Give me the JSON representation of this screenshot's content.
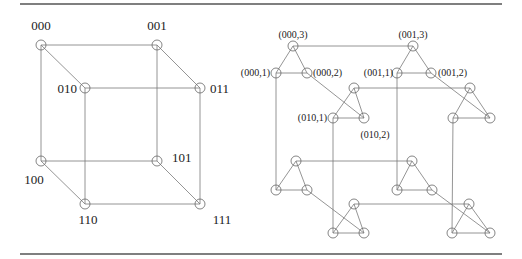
{
  "figure": {
    "left": {
      "title": "3-cube",
      "nodes": [
        {
          "id": "000",
          "label": "000",
          "x": 41,
          "y": 45,
          "lx": 41,
          "ly": 30,
          "anchor": "middle"
        },
        {
          "id": "001",
          "label": "001",
          "x": 157,
          "y": 45,
          "lx": 157,
          "ly": 30,
          "anchor": "middle"
        },
        {
          "id": "010",
          "label": "010",
          "x": 85,
          "y": 88,
          "lx": 77,
          "ly": 93,
          "anchor": "end"
        },
        {
          "id": "011",
          "label": "011",
          "x": 200,
          "y": 88,
          "lx": 210,
          "ly": 93,
          "anchor": "start"
        },
        {
          "id": "100",
          "label": "100",
          "x": 41,
          "y": 161,
          "lx": 34,
          "ly": 184,
          "anchor": "middle"
        },
        {
          "id": "101",
          "label": "101",
          "x": 157,
          "y": 161,
          "lx": 172,
          "ly": 162,
          "anchor": "start"
        },
        {
          "id": "110",
          "label": "110",
          "x": 85,
          "y": 204,
          "lx": 88,
          "ly": 224,
          "anchor": "middle"
        },
        {
          "id": "111",
          "label": "111",
          "x": 200,
          "y": 204,
          "lx": 222,
          "ly": 224,
          "anchor": "middle"
        }
      ],
      "edges": [
        [
          "000",
          "001"
        ],
        [
          "010",
          "011"
        ],
        [
          "100",
          "101"
        ],
        [
          "110",
          "111"
        ],
        [
          "000",
          "010"
        ],
        [
          "001",
          "011"
        ],
        [
          "100",
          "110"
        ],
        [
          "101",
          "111"
        ],
        [
          "000",
          "100"
        ],
        [
          "001",
          "101"
        ],
        [
          "010",
          "110"
        ],
        [
          "011",
          "111"
        ]
      ]
    },
    "right": {
      "title": "cube-connected cycles",
      "nodes": [
        {
          "id": "000,3",
          "label": "(000,3)",
          "x": 293,
          "y": 46,
          "lx": 293,
          "ly": 38,
          "anchor": "middle"
        },
        {
          "id": "000,1",
          "label": "(000,1)",
          "x": 276,
          "y": 73,
          "lx": 270,
          "ly": 76,
          "anchor": "end"
        },
        {
          "id": "000,2",
          "label": "(000,2)",
          "x": 307,
          "y": 73,
          "lx": 313,
          "ly": 76,
          "anchor": "start"
        },
        {
          "id": "001,3",
          "label": "(001,3)",
          "x": 413,
          "y": 46,
          "lx": 413,
          "ly": 38,
          "anchor": "middle"
        },
        {
          "id": "001,1",
          "label": "(001,1)",
          "x": 397,
          "y": 73,
          "lx": 393,
          "ly": 76,
          "anchor": "end"
        },
        {
          "id": "001,2",
          "label": "(001,2)",
          "x": 431,
          "y": 73,
          "lx": 438,
          "ly": 76,
          "anchor": "start"
        },
        {
          "id": "010,3",
          "label": "",
          "x": 354,
          "y": 88,
          "lx": 0,
          "ly": 0,
          "anchor": "middle"
        },
        {
          "id": "010,1",
          "label": "(010,1)",
          "x": 333,
          "y": 118,
          "lx": 327,
          "ly": 121,
          "anchor": "end"
        },
        {
          "id": "010,2",
          "label": "(010,2)",
          "x": 364,
          "y": 118,
          "lx": 375,
          "ly": 138,
          "anchor": "middle"
        },
        {
          "id": "011,3",
          "label": "",
          "x": 470,
          "y": 88,
          "lx": 0,
          "ly": 0,
          "anchor": "middle"
        },
        {
          "id": "011,1",
          "label": "",
          "x": 453,
          "y": 118,
          "lx": 0,
          "ly": 0,
          "anchor": "middle"
        },
        {
          "id": "011,2",
          "label": "",
          "x": 490,
          "y": 118,
          "lx": 0,
          "ly": 0,
          "anchor": "middle"
        },
        {
          "id": "100,3",
          "label": "",
          "x": 296,
          "y": 161,
          "lx": 0,
          "ly": 0,
          "anchor": "middle"
        },
        {
          "id": "100,1",
          "label": "",
          "x": 276,
          "y": 190,
          "lx": 0,
          "ly": 0,
          "anchor": "middle"
        },
        {
          "id": "100,2",
          "label": "",
          "x": 307,
          "y": 190,
          "lx": 0,
          "ly": 0,
          "anchor": "middle"
        },
        {
          "id": "101,3",
          "label": "",
          "x": 412,
          "y": 161,
          "lx": 0,
          "ly": 0,
          "anchor": "middle"
        },
        {
          "id": "101,1",
          "label": "",
          "x": 397,
          "y": 190,
          "lx": 0,
          "ly": 0,
          "anchor": "middle"
        },
        {
          "id": "101,2",
          "label": "",
          "x": 432,
          "y": 190,
          "lx": 0,
          "ly": 0,
          "anchor": "middle"
        },
        {
          "id": "110,3",
          "label": "",
          "x": 354,
          "y": 204,
          "lx": 0,
          "ly": 0,
          "anchor": "middle"
        },
        {
          "id": "110,1",
          "label": "",
          "x": 333,
          "y": 233,
          "lx": 0,
          "ly": 0,
          "anchor": "middle"
        },
        {
          "id": "110,2",
          "label": "",
          "x": 364,
          "y": 233,
          "lx": 0,
          "ly": 0,
          "anchor": "middle"
        },
        {
          "id": "111,3",
          "label": "",
          "x": 469,
          "y": 204,
          "lx": 0,
          "ly": 0,
          "anchor": "middle"
        },
        {
          "id": "111,1",
          "label": "",
          "x": 452,
          "y": 233,
          "lx": 0,
          "ly": 0,
          "anchor": "middle"
        },
        {
          "id": "111,2",
          "label": "",
          "x": 490,
          "y": 233,
          "lx": 0,
          "ly": 0,
          "anchor": "middle"
        }
      ],
      "edges": [
        [
          "000,1",
          "000,2"
        ],
        [
          "000,2",
          "000,3"
        ],
        [
          "000,3",
          "000,1"
        ],
        [
          "001,1",
          "001,2"
        ],
        [
          "001,2",
          "001,3"
        ],
        [
          "001,3",
          "001,1"
        ],
        [
          "010,1",
          "010,2"
        ],
        [
          "010,2",
          "010,3"
        ],
        [
          "010,3",
          "010,1"
        ],
        [
          "011,1",
          "011,2"
        ],
        [
          "011,2",
          "011,3"
        ],
        [
          "011,3",
          "011,1"
        ],
        [
          "100,1",
          "100,2"
        ],
        [
          "100,2",
          "100,3"
        ],
        [
          "100,3",
          "100,1"
        ],
        [
          "101,1",
          "101,2"
        ],
        [
          "101,2",
          "101,3"
        ],
        [
          "101,3",
          "101,1"
        ],
        [
          "110,1",
          "110,2"
        ],
        [
          "110,2",
          "110,3"
        ],
        [
          "110,3",
          "110,1"
        ],
        [
          "111,1",
          "111,2"
        ],
        [
          "111,2",
          "111,3"
        ],
        [
          "111,3",
          "111,1"
        ],
        [
          "000,3",
          "001,3"
        ],
        [
          "010,3",
          "011,3"
        ],
        [
          "100,3",
          "101,3"
        ],
        [
          "110,3",
          "111,3"
        ],
        [
          "000,2",
          "010,2"
        ],
        [
          "001,2",
          "011,2"
        ],
        [
          "100,2",
          "110,2"
        ],
        [
          "101,2",
          "111,2"
        ],
        [
          "000,1",
          "100,1"
        ],
        [
          "001,1",
          "101,1"
        ],
        [
          "010,1",
          "110,1"
        ],
        [
          "011,1",
          "111,1"
        ]
      ]
    },
    "rules": {
      "x1": 20,
      "x2": 502,
      "top_y": 4,
      "bottom_y": 254
    },
    "node_radius": 5
  }
}
